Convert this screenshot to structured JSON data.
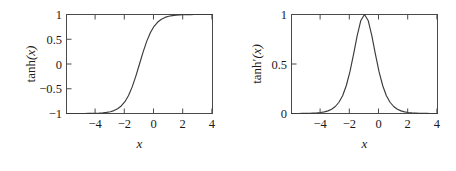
{
  "figure": {
    "background_color": "#ffffff",
    "line_color": "#3a3a3a",
    "axis_color": "#4a4a4a",
    "text_color": "#1a1a1a"
  },
  "chart_data": [
    {
      "type": "line",
      "title": "",
      "panel": "left",
      "xlabel": "x",
      "ylabel": "tanh(x)",
      "ylabel_base": "tanh",
      "ylabel_prime": "",
      "ylabel_arg": "(x)",
      "xlim": [
        -5,
        5
      ],
      "ylim": [
        -1,
        1
      ],
      "grid": false,
      "legend": "none",
      "xticks": [
        -4,
        -2,
        0,
        2,
        4
      ],
      "xtick_labels": [
        "−4",
        "−2",
        "0",
        "2",
        "4"
      ],
      "yticks": [
        -1,
        -0.5,
        0,
        0.5,
        1
      ],
      "ytick_labels": [
        "−1",
        "−0.5",
        "0",
        "0.5",
        "1"
      ],
      "series": [
        {
          "name": "tanh(x)",
          "x": [
            -5,
            -4.75,
            -4.5,
            -4.25,
            -4,
            -3.75,
            -3.5,
            -3.25,
            -3,
            -2.75,
            -2.5,
            -2.25,
            -2,
            -1.75,
            -1.5,
            -1.25,
            -1,
            -0.75,
            -0.5,
            -0.25,
            0,
            0.25,
            0.5,
            0.75,
            1,
            1.25,
            1.5,
            1.75,
            2,
            2.25,
            2.5,
            2.75,
            3,
            3.25,
            3.5,
            3.75,
            4,
            4.25,
            4.5,
            4.75,
            5
          ],
          "values": [
            -0.9999,
            -0.9999,
            -0.9998,
            -0.9996,
            -0.9993,
            -0.9989,
            -0.9982,
            -0.997,
            -0.9951,
            -0.9919,
            -0.9866,
            -0.978,
            -0.964,
            -0.9414,
            -0.9051,
            -0.8483,
            -0.7616,
            -0.6351,
            -0.4621,
            -0.2449,
            0.0,
            0.2449,
            0.4621,
            0.6351,
            0.7616,
            0.8483,
            0.9051,
            0.9414,
            0.964,
            0.978,
            0.9866,
            0.9919,
            0.9951,
            0.997,
            0.9982,
            0.9989,
            0.9993,
            0.9996,
            0.9998,
            0.9999,
            0.9999
          ]
        }
      ]
    },
    {
      "type": "line",
      "title": "",
      "panel": "right",
      "xlabel": "x",
      "ylabel": "tanh′(x)",
      "ylabel_base": "tanh",
      "ylabel_prime": "′",
      "ylabel_arg": "(x)",
      "xlim": [
        -5,
        5
      ],
      "ylim": [
        0,
        1
      ],
      "grid": false,
      "legend": "none",
      "xticks": [
        -4,
        -2,
        0,
        2,
        4
      ],
      "xtick_labels": [
        "−4",
        "−2",
        "0",
        "2",
        "4"
      ],
      "yticks": [
        0,
        0.5,
        1
      ],
      "ytick_labels": [
        "0",
        "0.5",
        "1"
      ],
      "series": [
        {
          "name": "tanh'(x)",
          "x": [
            -5,
            -4.75,
            -4.5,
            -4.25,
            -4,
            -3.75,
            -3.5,
            -3.25,
            -3,
            -2.75,
            -2.5,
            -2.25,
            -2,
            -1.75,
            -1.5,
            -1.25,
            -1,
            -0.75,
            -0.5,
            -0.25,
            0,
            0.25,
            0.5,
            0.75,
            1,
            1.25,
            1.5,
            1.75,
            2,
            2.25,
            2.5,
            2.75,
            3,
            3.25,
            3.5,
            3.75,
            4,
            4.25,
            4.5,
            4.75,
            5
          ],
          "values": [
            0.0002,
            0.0003,
            0.0004,
            0.0007,
            0.0013,
            0.0022,
            0.0037,
            0.006,
            0.0099,
            0.0163,
            0.0266,
            0.0435,
            0.0707,
            0.1136,
            0.1799,
            0.2804,
            0.42,
            0.5966,
            0.7864,
            0.94,
            1.0,
            0.94,
            0.7864,
            0.5966,
            0.42,
            0.2804,
            0.1799,
            0.1136,
            0.0707,
            0.0435,
            0.0266,
            0.0163,
            0.0099,
            0.006,
            0.0037,
            0.0022,
            0.0013,
            0.0007,
            0.0004,
            0.0003,
            0.0002
          ]
        }
      ]
    }
  ]
}
